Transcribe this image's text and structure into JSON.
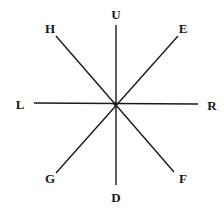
{
  "diagram": {
    "type": "eight-direction star",
    "center": {
      "x": 115,
      "y": 104
    },
    "line_color": "#1a1a1a",
    "labels": {
      "U": "U",
      "H": "H",
      "E": "E",
      "L": "L",
      "R": "R",
      "G": "G",
      "F": "F",
      "D": "D"
    }
  }
}
